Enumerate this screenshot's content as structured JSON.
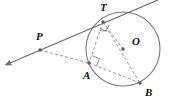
{
  "diagram": {
    "canvas": {
      "width": 173,
      "height": 101
    },
    "colors": {
      "stroke_solid": "#6e6e72",
      "stroke_dashed": "#8a8a8f",
      "circle": "#7a7a7f",
      "point_fill": "#5c5c60",
      "label_text": "#111111",
      "background": "#ffffff"
    },
    "circle": {
      "name": "circle-O",
      "center_label": "O",
      "cx": 123,
      "cy": 49,
      "r": 37
    },
    "points": [
      {
        "id": "T",
        "label": "T",
        "x": 103,
        "y": 22,
        "label_x": 100,
        "label_y": 11,
        "role": "tangent-point"
      },
      {
        "id": "P",
        "label": "P",
        "x": 40,
        "y": 50,
        "label_x": 36,
        "label_y": 40,
        "role": "external-point"
      },
      {
        "id": "O",
        "label": "O",
        "x": 123,
        "y": 49,
        "label_x": 132,
        "label_y": 45,
        "role": "center"
      },
      {
        "id": "A",
        "label": "A",
        "x": 89,
        "y": 63,
        "label_x": 83,
        "label_y": 79,
        "role": "intersection-point"
      },
      {
        "id": "B",
        "label": "B",
        "x": 140,
        "y": 83,
        "label_x": 145,
        "label_y": 96,
        "role": "circle-point"
      }
    ],
    "solid_lines": [
      {
        "name": "tangent-line-PT",
        "x1": 10,
        "y1": 63,
        "x2": 158,
        "y2": 0,
        "arrow_start": true,
        "arrow_end": false
      }
    ],
    "dashed_lines": [
      {
        "name": "segment-PA",
        "x1": 40,
        "y1": 50,
        "x2": 89,
        "y2": 63
      },
      {
        "name": "segment-AB",
        "x1": 89,
        "y1": 63,
        "x2": 140,
        "y2": 83
      },
      {
        "name": "segment-TA",
        "x1": 103,
        "y1": 22,
        "x2": 89,
        "y2": 63
      },
      {
        "name": "segment-TB",
        "x1": 103,
        "y1": 22,
        "x2": 140,
        "y2": 83
      },
      {
        "name": "segment-TO",
        "x1": 103,
        "y1": 22,
        "x2": 123,
        "y2": 49
      }
    ],
    "right_angles": [
      {
        "name": "right-angle-at-A",
        "x": 89,
        "y": 63,
        "size": 8,
        "rotation": 22
      },
      {
        "name": "right-angle-at-T",
        "x": 103,
        "y": 22,
        "size": 7,
        "rotation": 118
      }
    ],
    "angle_arc": {
      "name": "angle-arc-at-T",
      "cx": 103,
      "cy": 22,
      "r": 9,
      "start_deg": 70,
      "end_deg": 112
    }
  }
}
